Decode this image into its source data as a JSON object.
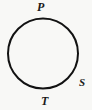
{
  "figure": {
    "kind": "geometry-diagram",
    "background_color": "#f8f8f6",
    "stroke_color": "#121212",
    "label_color": "#1a1a1a",
    "circle": {
      "center_x": 43,
      "center_y": 53.5,
      "radius": 35,
      "stroke_width": 2
    },
    "labels": [
      {
        "id": "P",
        "text": "P",
        "position": "top",
        "x": 37,
        "y": 1
      },
      {
        "id": "S",
        "text": "S",
        "position": "lower-right",
        "x": 79,
        "y": 77
      },
      {
        "id": "T",
        "text": "T",
        "position": "bottom",
        "x": 41,
        "y": 95
      }
    ]
  }
}
